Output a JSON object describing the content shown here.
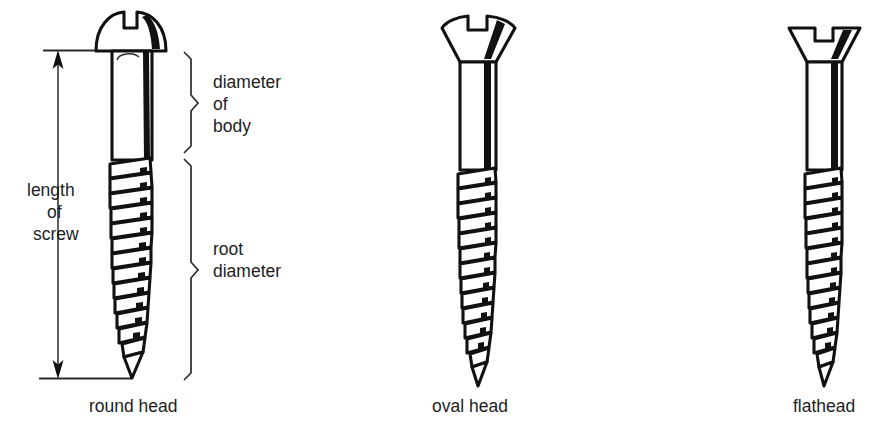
{
  "figure": {
    "background_color": "#ffffff",
    "ink_color": "#111111",
    "line_color": "#2b2b2b"
  },
  "dimensions": {
    "length_of_screw": {
      "lines": [
        "length",
        "of",
        "screw"
      ],
      "arrow_style": "double-headed-vertical"
    },
    "diameter_of_body": {
      "lines": [
        "diameter",
        "of",
        "body"
      ],
      "brace_style": "curly-right"
    },
    "root_diameter": {
      "lines": [
        "root",
        "diameter"
      ],
      "brace_style": "curly-right"
    }
  },
  "screws": [
    {
      "id": "round-head",
      "caption": "round head",
      "head_type": "round",
      "slot": "single-slotted",
      "thread_count": 13
    },
    {
      "id": "oval-head",
      "caption": "oval head",
      "head_type": "oval",
      "slot": "single-slotted",
      "thread_count": 13
    },
    {
      "id": "flathead",
      "caption": "flathead",
      "head_type": "flat",
      "slot": "single-slotted",
      "thread_count": 13
    }
  ]
}
